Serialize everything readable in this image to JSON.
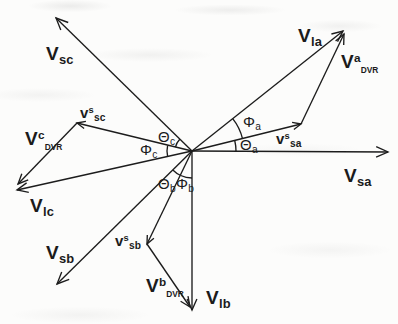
{
  "figure": {
    "width": 398,
    "height": 324,
    "background": "#fcfcfb",
    "stroke_color": "#1c1c1c",
    "stroke_width": 1.35,
    "origin": {
      "x": 192,
      "y": 151
    }
  },
  "diagram": {
    "type": "phasor-vector-diagram",
    "vectors": [
      {
        "id": "v-sa",
        "label_text": "V_sa",
        "from": [
          192,
          151
        ],
        "to": [
          388,
          152
        ],
        "arrow": 13
      },
      {
        "id": "v-s-sa",
        "label_text": "v^s_sa",
        "from": [
          192,
          151
        ],
        "to": [
          301,
          124
        ],
        "arrow": 9
      },
      {
        "id": "v-la",
        "label_text": "V_la",
        "from": [
          192,
          151
        ],
        "to": [
          343,
          31
        ],
        "arrow": 12
      },
      {
        "id": "v-a-dvr",
        "label_text": "V^a_DVR",
        "from": [
          301,
          124
        ],
        "to": [
          344,
          34
        ],
        "arrow": 11
      },
      {
        "id": "v-sc",
        "label_text": "V_sc",
        "from": [
          192,
          151
        ],
        "to": [
          56,
          18
        ],
        "arrow": 13
      },
      {
        "id": "v-s-sc",
        "label_text": "v^s_sc",
        "from": [
          192,
          151
        ],
        "to": [
          77,
          123
        ],
        "arrow": 9
      },
      {
        "id": "v-lc",
        "label_text": "V_lc",
        "from": [
          192,
          151
        ],
        "to": [
          17,
          190
        ],
        "arrow": 12
      },
      {
        "id": "v-c-dvr",
        "label_text": "V^c_DVR",
        "from": [
          77,
          123
        ],
        "to": [
          18,
          184
        ],
        "arrow": 11
      },
      {
        "id": "v-sb",
        "label_text": "V_sb",
        "from": [
          192,
          151
        ],
        "to": [
          57,
          284
        ],
        "arrow": 13
      },
      {
        "id": "v-s-sb",
        "label_text": "v^s_sb",
        "from": [
          192,
          151
        ],
        "to": [
          147,
          244
        ],
        "arrow": 9
      },
      {
        "id": "v-lb",
        "label_text": "V_lb",
        "from": [
          192,
          151
        ],
        "to": [
          192,
          310
        ],
        "arrow": 12
      },
      {
        "id": "v-b-dvr",
        "label_text": "V^b_DVR",
        "from": [
          147,
          244
        ],
        "to": [
          190,
          307
        ],
        "arrow": 11
      }
    ],
    "angle_arcs": [
      {
        "id": "theta-a",
        "label_text": "Theta_a",
        "radius": 44,
        "start_deg": 0,
        "end_deg": 13.5
      },
      {
        "id": "phi-a",
        "label_text": "Phi_a",
        "radius": 52,
        "start_deg": 13.5,
        "end_deg": 38.5
      },
      {
        "id": "theta-c",
        "label_text": "Theta_c",
        "radius": 17,
        "start_deg": 136,
        "end_deg": 167
      },
      {
        "id": "phi-c",
        "label_text": "Phi_c",
        "radius": 25,
        "start_deg": 167,
        "end_deg": 193
      },
      {
        "id": "theta-b",
        "label_text": "Theta_b",
        "radius": 27,
        "start_deg": 224.8,
        "end_deg": 245.2
      },
      {
        "id": "phi-b",
        "label_text": "Phi_b",
        "radius": 27,
        "start_deg": 245.2,
        "end_deg": 270
      }
    ],
    "labels": [
      {
        "id": "v-sc",
        "x": 46,
        "y": 44,
        "main": "V",
        "sup": "",
        "sub": "sc",
        "size": "lg",
        "subsmall": false
      },
      {
        "id": "v-la",
        "x": 298,
        "y": 26,
        "main": "V",
        "sup": "",
        "sub": "la",
        "size": "lg",
        "subsmall": false
      },
      {
        "id": "v-a-dvr",
        "x": 341,
        "y": 52,
        "main": "V",
        "sup": "a",
        "sub": "DVR",
        "size": "lg",
        "subsmall": true
      },
      {
        "id": "v-s-sc",
        "x": 80,
        "y": 105,
        "main": "v",
        "sup": "s",
        "sub": "sc",
        "size": "md",
        "subsmall": false
      },
      {
        "id": "v-c-dvr",
        "x": 25,
        "y": 129,
        "main": "V",
        "sup": "c",
        "sub": "DVR",
        "size": "lg",
        "subsmall": true
      },
      {
        "id": "theta-c",
        "x": 158,
        "y": 129,
        "main": "Θ",
        "sup": "",
        "sub": "c",
        "size": "sm",
        "subsmall": false
      },
      {
        "id": "phi-c",
        "x": 140,
        "y": 142,
        "main": "Φ",
        "sup": "",
        "sub": "c",
        "size": "sm",
        "subsmall": false
      },
      {
        "id": "phi-a",
        "x": 243,
        "y": 114,
        "main": "Φ",
        "sup": "",
        "sub": "a",
        "size": "sm",
        "subsmall": false
      },
      {
        "id": "theta-a",
        "x": 240,
        "y": 137,
        "main": "Θ",
        "sup": "",
        "sub": "a",
        "size": "sm",
        "subsmall": false
      },
      {
        "id": "v-s-sa",
        "x": 276,
        "y": 131,
        "main": "v",
        "sup": "s",
        "sub": "sa",
        "size": "md",
        "subsmall": false
      },
      {
        "id": "v-sa",
        "x": 344,
        "y": 166,
        "main": "V",
        "sup": "",
        "sub": "sa",
        "size": "lg",
        "subsmall": false
      },
      {
        "id": "v-lc",
        "x": 30,
        "y": 196,
        "main": "V",
        "sup": "",
        "sub": "lc",
        "size": "lg",
        "subsmall": false
      },
      {
        "id": "theta-b",
        "x": 158,
        "y": 176,
        "main": "Θ",
        "sup": "",
        "sub": "b",
        "size": "sm",
        "subsmall": false
      },
      {
        "id": "phi-b",
        "x": 176,
        "y": 176,
        "main": "Φ",
        "sup": "",
        "sub": "b",
        "size": "sm",
        "subsmall": false
      },
      {
        "id": "v-sb",
        "x": 46,
        "y": 243,
        "main": "V",
        "sup": "",
        "sub": "sb",
        "size": "lg",
        "subsmall": false
      },
      {
        "id": "v-s-sb",
        "x": 115,
        "y": 233,
        "main": "v",
        "sup": "s",
        "sub": "sb",
        "size": "md",
        "subsmall": false
      },
      {
        "id": "v-b-dvr",
        "x": 146,
        "y": 276,
        "main": "V",
        "sup": "b",
        "sub": "DVR",
        "size": "lg",
        "subsmall": true
      },
      {
        "id": "v-lb",
        "x": 206,
        "y": 288,
        "main": "V",
        "sup": "",
        "sub": "lb",
        "size": "lg",
        "subsmall": false
      }
    ]
  }
}
